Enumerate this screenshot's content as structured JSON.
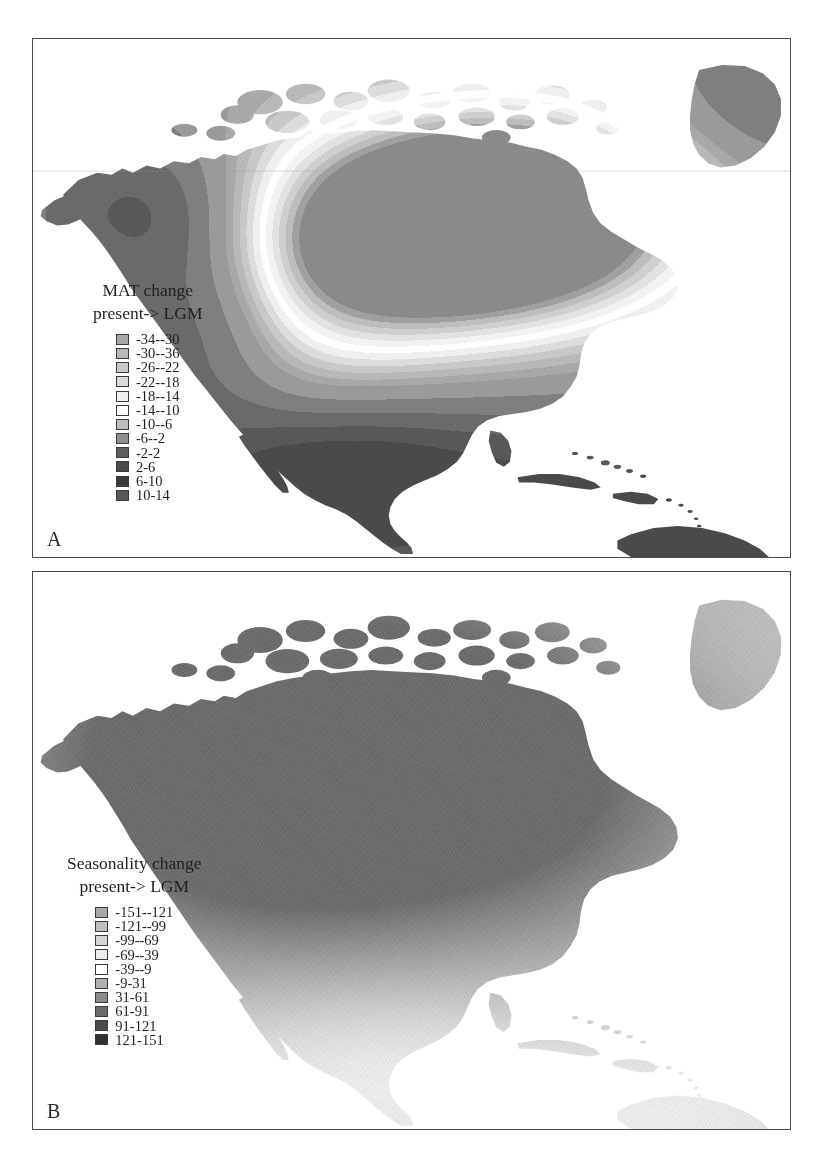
{
  "figure": {
    "background": "#ffffff",
    "frame_color": "#4a4a4a",
    "width": 823,
    "height": 1163
  },
  "panels": [
    {
      "id": "A",
      "letter": "A",
      "region": "North America",
      "map_type": "contour-filled grayscale anomaly map",
      "legend": {
        "title_line1": "MAT change",
        "title_line2": "present-> LGM",
        "units": "°C",
        "items": [
          {
            "label": "-34--30",
            "color": "#a8a8a8"
          },
          {
            "label": "-30--36",
            "color": "#b8b8b8"
          },
          {
            "label": "-26--22",
            "color": "#c8c8c8"
          },
          {
            "label": "-22--18",
            "color": "#dcdcdc"
          },
          {
            "label": "-18--14",
            "color": "#efefef"
          },
          {
            "label": "-14--10",
            "color": "#ffffff"
          },
          {
            "label": "-10--6",
            "color": "#bdbdbd"
          },
          {
            "label": "-6--2",
            "color": "#8f8f8f"
          },
          {
            "label": "-2-2",
            "color": "#5e5e5e"
          },
          {
            "label": "2-6",
            "color": "#4a4a4a"
          },
          {
            "label": "6-10",
            "color": "#3a3a3a"
          },
          {
            "label": "10-14",
            "color": "#585858"
          }
        ]
      }
    },
    {
      "id": "B",
      "letter": "B",
      "region": "North America",
      "map_type": "continuous dithered grayscale anomaly map",
      "legend": {
        "title_line1": "Seasonality change",
        "title_line2": "present-> LGM",
        "units": "",
        "items": [
          {
            "label": "-151--121",
            "color": "#a8a8a8"
          },
          {
            "label": "-121--99",
            "color": "#bfbfbf"
          },
          {
            "label": "-99--69",
            "color": "#d6d6d6"
          },
          {
            "label": "-69--39",
            "color": "#ececec"
          },
          {
            "label": "-39--9",
            "color": "#ffffff"
          },
          {
            "label": "-9-31",
            "color": "#b0b0b0"
          },
          {
            "label": "31-61",
            "color": "#8a8a8a"
          },
          {
            "label": "61-91",
            "color": "#6a6a6a"
          },
          {
            "label": "91-121",
            "color": "#4a4a4a"
          },
          {
            "label": "121-151",
            "color": "#303030"
          }
        ]
      }
    }
  ]
}
